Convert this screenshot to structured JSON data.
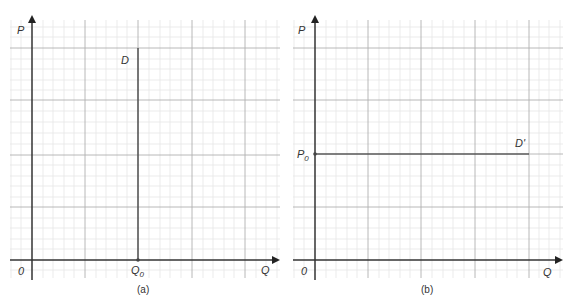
{
  "panels": [
    {
      "id": "a",
      "caption": "(a)",
      "y_axis_label": "P",
      "x_axis_label": "Q",
      "origin_label": "0",
      "curve_label": "D",
      "marker_label_main": "Q",
      "marker_label_sub": "0",
      "curve_type": "vertical"
    },
    {
      "id": "b",
      "caption": "(b)",
      "y_axis_label": "P",
      "x_axis_label": "Q",
      "origin_label": "0",
      "curve_label": "D'",
      "marker_label_main": "P",
      "marker_label_sub": "0",
      "curve_type": "horizontal"
    }
  ],
  "colors": {
    "axis": "#333333",
    "curve": "#555555",
    "major_grid": "#b5b5b5",
    "minor_grid": "#e3e3e3",
    "text": "#333333"
  }
}
